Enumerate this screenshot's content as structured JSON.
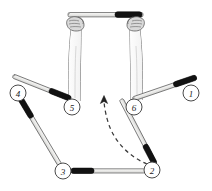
{
  "figure": {
    "type": "instructional-motion-diagram",
    "background_color": "#ffffff",
    "stroke_color": "#3a3a3a",
    "handle_color": "#111111",
    "shaft_fill": "#e8e8e6",
    "arrow_color": "#3a3a3a",
    "width": 212,
    "height": 191
  },
  "markers": [
    {
      "id": "marker-1",
      "label": "1",
      "cx": 191,
      "cy": 93,
      "r": 8
    },
    {
      "id": "marker-2",
      "label": "2",
      "cx": 152,
      "cy": 170,
      "r": 8
    },
    {
      "id": "marker-3",
      "label": "3",
      "cx": 63,
      "cy": 171,
      "r": 8
    },
    {
      "id": "marker-4",
      "label": "4",
      "cx": 18,
      "cy": 93,
      "r": 8
    },
    {
      "id": "marker-5",
      "label": "5",
      "cx": 72,
      "cy": 107,
      "r": 8
    },
    {
      "id": "marker-6",
      "label": "6",
      "cx": 134,
      "cy": 107,
      "r": 8
    }
  ],
  "bars": [
    {
      "id": "bar-top-held",
      "description": "horizontal bar gripped by both hands",
      "x1": 68,
      "y1": 16,
      "x2": 143,
      "y2": 14,
      "handle_end": "right"
    },
    {
      "id": "bar-upper-left",
      "description": "bar from upper-left toward marker 5",
      "x1": 13,
      "y1": 76,
      "x2": 71,
      "y2": 99,
      "handle_end": "right"
    },
    {
      "id": "bar-upper-right",
      "description": "bar from marker 6 toward upper-right marker 1",
      "x1": 133,
      "y1": 99,
      "x2": 197,
      "y2": 77,
      "handle_end": "right"
    },
    {
      "id": "bar-left-diagonal",
      "description": "bar from marker 4 down to marker 3",
      "x1": 20,
      "y1": 98,
      "x2": 60,
      "y2": 165,
      "handle_end": "left"
    },
    {
      "id": "bar-right-diagonal",
      "description": "bar from marker 1 down to marker 2",
      "x1": 189,
      "y1": 99,
      "x2": 155,
      "y2": 164,
      "handle_end": "right"
    },
    {
      "id": "bar-bottom",
      "description": "horizontal bar from marker 3 to marker 2",
      "x1": 71,
      "y1": 171,
      "x2": 145,
      "y2": 170,
      "handle_end": "left"
    }
  ],
  "motion_arrow": {
    "id": "motion-arrow",
    "style": "dashed-curved",
    "from": {
      "x": 146,
      "y": 163
    },
    "to": {
      "x": 105,
      "y": 98
    },
    "direction": "up-left",
    "head": "arrowhead-up"
  },
  "arms": [
    {
      "id": "arm-left",
      "hand_x": 76,
      "hand_y": 24,
      "wrist_x": 78,
      "bottom_y": 102
    },
    {
      "id": "arm-right",
      "hand_x": 136,
      "hand_y": 24,
      "wrist_x": 134,
      "bottom_y": 102
    }
  ]
}
